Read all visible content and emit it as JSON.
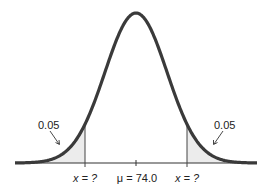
{
  "figure": {
    "type": "normal-distribution",
    "mean_label": "μ = 74.0",
    "mean_symbol": "μ",
    "mean_value": "74.0",
    "left_cutoff_label": "x = ?",
    "right_cutoff_label": "x = ?",
    "left_tail_area": "0.05",
    "right_tail_area": "0.05"
  },
  "colors": {
    "curve": "#3a3a3a",
    "tail_fill": "#ececec",
    "lines": "#333333",
    "text": "#222222"
  }
}
